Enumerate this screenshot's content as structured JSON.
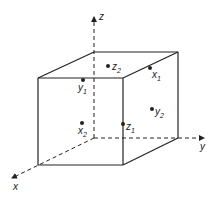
{
  "diagram": {
    "type": "3d-cube-with-axes",
    "colors": {
      "stroke": "#222222",
      "background": "#ffffff"
    },
    "axes": [
      {
        "name": "x",
        "label": "x",
        "from": [
          94,
          138
        ],
        "to": [
          12,
          178
        ],
        "label_pos": [
          13,
          190
        ],
        "style": "dashed"
      },
      {
        "name": "y",
        "label": "y",
        "from": [
          94,
          138
        ],
        "to": [
          204,
          138
        ],
        "label_pos": [
          200,
          150
        ],
        "style": "dashed"
      },
      {
        "name": "z",
        "label": "z",
        "from": [
          94,
          138
        ],
        "to": [
          94,
          17
        ],
        "label_pos": [
          99,
          20
        ],
        "style": "dashed"
      }
    ],
    "cube": {
      "front": {
        "tl": [
          38,
          78
        ],
        "tr": [
          123,
          78
        ],
        "br": [
          123,
          165
        ],
        "bl": [
          38,
          165
        ]
      },
      "back": {
        "tl": [
          94,
          52
        ],
        "tr": [
          178,
          52
        ],
        "br": [
          178,
          138
        ],
        "bl": [
          94,
          138
        ]
      }
    },
    "points": [
      {
        "id": "z2",
        "base": "z",
        "sub": "2",
        "dot": [
          108,
          66
        ],
        "label_pos": [
          112,
          70
        ]
      },
      {
        "id": "x1",
        "base": "x",
        "sub": "1",
        "dot": [
          150,
          68
        ],
        "label_pos": [
          152,
          78
        ]
      },
      {
        "id": "y1",
        "base": "y",
        "sub": "1",
        "dot": [
          83,
          80
        ],
        "label_pos": [
          78,
          91
        ]
      },
      {
        "id": "y2",
        "base": "y",
        "sub": "2",
        "dot": [
          152,
          109
        ],
        "label_pos": [
          155,
          115
        ]
      },
      {
        "id": "x2",
        "base": "x",
        "sub": "2",
        "dot": [
          82,
          123
        ],
        "label_pos": [
          78,
          134
        ]
      },
      {
        "id": "z1",
        "base": "z",
        "sub": "1",
        "dot": [
          123,
          124
        ],
        "label_pos": [
          126,
          130
        ]
      }
    ]
  }
}
